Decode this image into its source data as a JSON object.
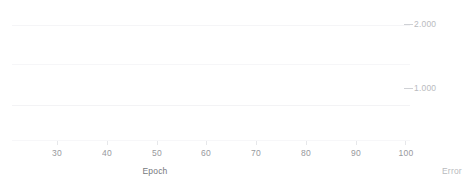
{
  "chart_data": {
    "type": "line",
    "title": "",
    "subtitle": "",
    "xlabel": "Epoch",
    "ylabel": "Error",
    "xlim": [
      20,
      104
    ],
    "ylim": [
      0,
      2.6
    ],
    "xticks": [
      30,
      40,
      50,
      60,
      70,
      80,
      90,
      100
    ],
    "xtick_labels": [
      "30",
      "40",
      "50",
      "60",
      "70",
      "80",
      "90",
      "100"
    ],
    "yticks": [
      1.0,
      2.0
    ],
    "ytick_labels": [
      "1.000",
      "2.000"
    ],
    "y_axis_position": "right",
    "grid": true,
    "gridlines_y": [
      0.1,
      0.75,
      1.4,
      2.05
    ],
    "legend": {
      "visible": false,
      "position": "none"
    },
    "x": [
      20,
      22,
      24,
      26,
      28,
      30,
      32,
      34,
      36,
      38,
      40,
      45,
      50,
      55,
      60,
      65,
      70,
      75,
      80,
      85,
      90,
      95,
      100,
      103
    ],
    "series": [
      {
        "name": "train-error",
        "color": "#9a9da2",
        "values": [
          0.165,
          0.172,
          0.182,
          0.196,
          0.208,
          0.212,
          0.205,
          0.193,
          0.18,
          0.168,
          0.158,
          0.152,
          0.15,
          0.149,
          0.148,
          0.147,
          0.147,
          0.146,
          0.146,
          0.145,
          0.145,
          0.145,
          0.144,
          0.144
        ]
      },
      {
        "name": "validation-error",
        "color": "#73767b",
        "values": [
          0.162,
          0.138,
          0.112,
          0.098,
          0.094,
          0.093,
          0.092,
          0.09,
          0.089,
          0.088,
          0.087,
          0.086,
          0.086,
          0.085,
          0.085,
          0.085,
          0.084,
          0.084,
          0.084,
          0.083,
          0.083,
          0.083,
          0.082,
          0.082
        ]
      }
    ]
  },
  "axes": {
    "x_title": "Epoch",
    "y_title": "Error",
    "x_ticks": [
      {
        "label": "30",
        "px": 57
      },
      {
        "label": "40",
        "px": 107
      },
      {
        "label": "50",
        "px": 157
      },
      {
        "label": "60",
        "px": 206
      },
      {
        "label": "70",
        "px": 256
      },
      {
        "label": "80",
        "px": 306
      },
      {
        "label": "90",
        "px": 356
      },
      {
        "label": "100",
        "px": 405
      }
    ],
    "y_ticks": [
      {
        "label": "2.000",
        "px": 24
      },
      {
        "label": "1.000",
        "px": 88
      }
    ]
  },
  "colors": {
    "background": "#ffffff",
    "grid": "#f4f4f6",
    "tick_text": "#8f9196",
    "y_tick_text": "#b4b6ba",
    "series_upper": "#9a9da2",
    "series_lower": "#73767b",
    "tick_dash": "#c9cbcf"
  }
}
